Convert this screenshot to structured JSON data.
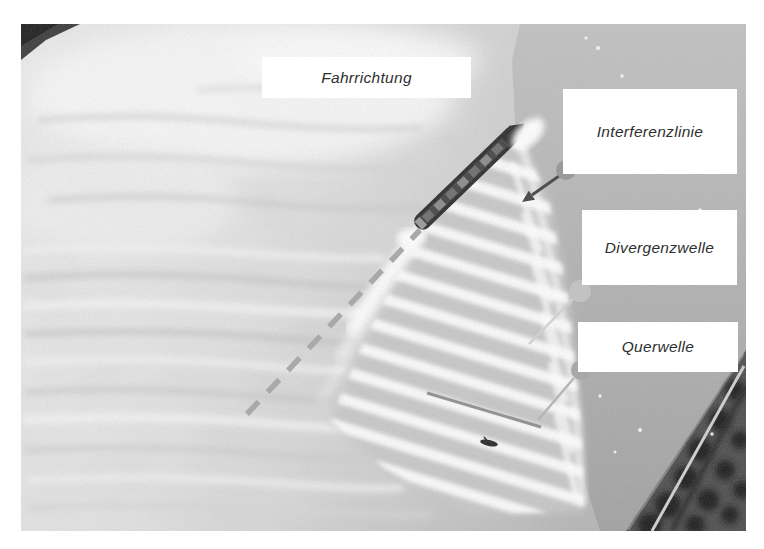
{
  "labels": {
    "fahrrichtung": "Fahrrichtung",
    "interferenzlinie": "Interferenzlinie",
    "divergenzwelle": "Divergenzwelle",
    "querwelle": "Querwelle"
  },
  "colors": {
    "page_background": "#ffffff",
    "label_background": "#ffffff",
    "label_text": "#2f2f2f",
    "dashed_line": "#a9a9a9",
    "interference_arrow": "#4f4f4f",
    "divergence_line": "#d0d0d0",
    "transverse_line": "#b5b5b5",
    "crest_highlight": "#8f8f8f",
    "circle_interferenzlinie": "#9a9a9a",
    "circle_divergenzwelle": "#c2c2c2",
    "circle_querwelle": "#a8a8a8"
  }
}
